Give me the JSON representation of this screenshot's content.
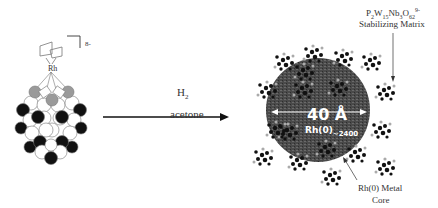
{
  "precursor": {
    "charge": "8-",
    "metal_label": "Rh"
  },
  "reaction": {
    "reagent": "H",
    "reagent_subscript": "2",
    "solvent": "acetone"
  },
  "nanocluster": {
    "diameter_label": "40 Å",
    "core_formula": "Rh(0)",
    "core_count": "~2400",
    "matrix_formula": {
      "p": "P",
      "p_sub": "2",
      "w": "W",
      "w_sub": "15",
      "nb": "Nb",
      "nb_sub": "3",
      "o": "O",
      "o_sub": "62",
      "charge": "9-"
    },
    "matrix_label": "Stabilizing Matrix",
    "core_label_line1": "Rh(0) Metal",
    "core_label_line2": "Core"
  },
  "colors": {
    "core": "#4a4a4a",
    "black_atom": "#111111",
    "gray_atom": "#9a9a9a",
    "white_atom": "#ffffff"
  }
}
